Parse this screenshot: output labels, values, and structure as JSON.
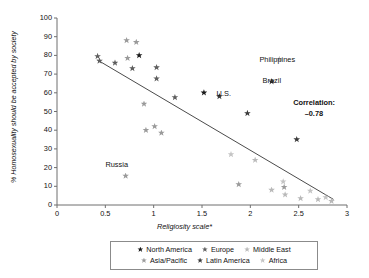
{
  "chart_data": {
    "type": "scatter",
    "title": "",
    "xlabel": "Religiosity scale*",
    "ylabel": "% Homosexuality should be accepted by society",
    "xlim": [
      0,
      3
    ],
    "ylim": [
      0,
      100
    ],
    "xticks": [
      "0",
      "0.5",
      "1",
      "1.5",
      "2",
      "2.5",
      "3"
    ],
    "yticks": [
      "0",
      "10",
      "20",
      "30",
      "40",
      "50",
      "60",
      "70",
      "80",
      "90",
      "100"
    ],
    "grid": false,
    "legend_position": "below-axes",
    "trendline": {
      "x1": 0.42,
      "y1": 77.5,
      "x2": 2.86,
      "y2": 3.0,
      "color": "#4b4b4b"
    },
    "annotations": [
      {
        "name": "philippines-label",
        "text": "Philippines",
        "x": 2.28,
        "y": 77.5
      },
      {
        "name": "brazil-label",
        "text": "Brazil",
        "x": 2.22,
        "y": 66.5
      },
      {
        "name": "us-label",
        "text": "U.S.",
        "x": 1.62,
        "y": 59.5
      },
      {
        "name": "russia-label",
        "text": "Russia",
        "x": 0.62,
        "y": 21.5
      },
      {
        "name": "correlation-label",
        "text": "Correlation:",
        "x": 2.66,
        "y": 54.5
      },
      {
        "name": "correlation-value",
        "text": "–0.78",
        "x": 2.66,
        "y": 48.5
      }
    ],
    "series": [
      {
        "name": "North America",
        "color": "#1b1b1b",
        "points": [
          {
            "x": 0.85,
            "y": 80.0
          },
          {
            "x": 1.52,
            "y": 60.0
          }
        ]
      },
      {
        "name": "Europe",
        "color": "#5e5e5e",
        "points": [
          {
            "x": 0.42,
            "y": 79.5
          },
          {
            "x": 0.44,
            "y": 77.0
          },
          {
            "x": 0.6,
            "y": 76.0
          },
          {
            "x": 0.78,
            "y": 73.0
          },
          {
            "x": 1.03,
            "y": 73.5
          },
          {
            "x": 1.03,
            "y": 67.5
          },
          {
            "x": 1.22,
            "y": 57.5
          }
        ]
      },
      {
        "name": "Middle East",
        "color": "#b9b9b9",
        "points": [
          {
            "x": 2.3,
            "y": 78.0
          },
          {
            "x": 2.05,
            "y": 24.0
          },
          {
            "x": 2.22,
            "y": 8.0
          },
          {
            "x": 2.36,
            "y": 5.5
          },
          {
            "x": 2.52,
            "y": 3.5
          },
          {
            "x": 2.7,
            "y": 3.0
          },
          {
            "x": 2.84,
            "y": 2.0
          }
        ]
      },
      {
        "name": "Asia/Pacific",
        "color": "#9a9a9a",
        "points": [
          {
            "x": 0.72,
            "y": 88.0
          },
          {
            "x": 0.82,
            "y": 87.0
          },
          {
            "x": 0.73,
            "y": 78.5
          },
          {
            "x": 0.9,
            "y": 54.0
          },
          {
            "x": 0.92,
            "y": 40.0
          },
          {
            "x": 1.01,
            "y": 42.0
          },
          {
            "x": 1.08,
            "y": 38.5
          },
          {
            "x": 0.71,
            "y": 15.5
          },
          {
            "x": 1.88,
            "y": 11.0
          },
          {
            "x": 2.35,
            "y": 9.5
          }
        ]
      },
      {
        "name": "Latin America",
        "color": "#3a3a3a",
        "points": [
          {
            "x": 2.22,
            "y": 66.0
          },
          {
            "x": 1.68,
            "y": 58.0
          },
          {
            "x": 1.97,
            "y": 49.0
          },
          {
            "x": 2.48,
            "y": 35.0
          }
        ]
      },
      {
        "name": "Africa",
        "color": "#c4c4c4",
        "points": [
          {
            "x": 2.34,
            "y": 12.5
          },
          {
            "x": 2.62,
            "y": 7.5
          },
          {
            "x": 2.78,
            "y": 4.0
          },
          {
            "x": 1.8,
            "y": 27.0
          }
        ]
      }
    ]
  },
  "legend": {
    "rows": [
      [
        {
          "label": "North America",
          "color": "#1b1b1b"
        },
        {
          "label": "Europe",
          "color": "#5e5e5e"
        },
        {
          "label": "Middle East",
          "color": "#b9b9b9"
        }
      ],
      [
        {
          "label": "Asia/Pacific",
          "color": "#9a9a9a"
        },
        {
          "label": "Latin America",
          "color": "#3a3a3a"
        },
        {
          "label": "Africa",
          "color": "#c4c4c4"
        }
      ]
    ]
  }
}
